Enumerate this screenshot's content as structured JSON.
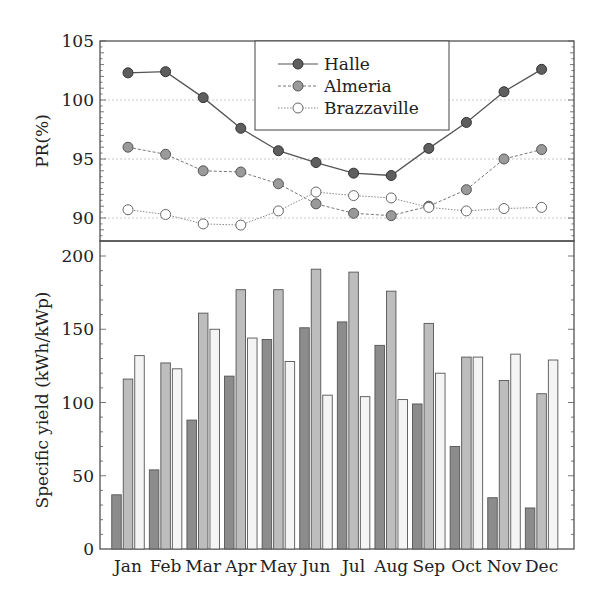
{
  "chart_data": [
    {
      "type": "line",
      "panel": "top",
      "title": "",
      "xlabel": "",
      "ylabel": "PR(%)",
      "ylim": [
        88.0,
        105
      ],
      "yticks": [
        90,
        95,
        100,
        105
      ],
      "grid": "horizontal dotted at 90, 95, 100",
      "legend_position": "upper center (boxed)",
      "categories": [
        "Jan",
        "Feb",
        "Mar",
        "Apr",
        "May",
        "Jun",
        "Jul",
        "Aug",
        "Sep",
        "Oct",
        "Nov",
        "Dec"
      ],
      "series": [
        {
          "name": "Halle",
          "marker": "dark-filled-circle",
          "line": "solid",
          "values": [
            102.3,
            102.4,
            100.2,
            97.6,
            95.7,
            94.7,
            93.8,
            93.6,
            95.9,
            98.1,
            100.7,
            102.6
          ]
        },
        {
          "name": "Almeria",
          "marker": "grey-filled-circle",
          "line": "dashed",
          "values": [
            96.0,
            95.4,
            94.0,
            93.9,
            92.9,
            91.2,
            90.4,
            90.2,
            91.0,
            92.4,
            95.0,
            95.8
          ]
        },
        {
          "name": "Brazzaville",
          "marker": "open-circle",
          "line": "dotted",
          "values": [
            90.7,
            90.3,
            89.5,
            89.4,
            90.6,
            92.2,
            91.9,
            91.7,
            90.9,
            90.6,
            90.8,
            90.9
          ]
        }
      ]
    },
    {
      "type": "bar",
      "panel": "bottom",
      "title": "",
      "xlabel": "",
      "ylabel": "Specific yield (kWh/kWp)",
      "ylim": [
        0,
        210
      ],
      "yticks": [
        0,
        50,
        100,
        150,
        200
      ],
      "grid": "off",
      "categories": [
        "Jan",
        "Feb",
        "Mar",
        "Apr",
        "May",
        "Jun",
        "Jul",
        "Aug",
        "Sep",
        "Oct",
        "Nov",
        "Dec"
      ],
      "series": [
        {
          "name": "Halle",
          "fill": "#8c8c8c",
          "values": [
            37,
            54,
            88,
            118,
            143,
            151,
            155,
            139,
            99,
            70,
            35,
            28
          ]
        },
        {
          "name": "Almeria",
          "fill": "#bdbdbd",
          "values": [
            116,
            127,
            161,
            177,
            177,
            191,
            189,
            176,
            154,
            131,
            115,
            106
          ]
        },
        {
          "name": "Brazzaville",
          "fill": "#f4f4f4",
          "values": [
            132,
            123,
            150,
            144,
            128,
            105,
            104,
            102,
            120,
            131,
            133,
            129
          ]
        }
      ]
    }
  ],
  "legend": {
    "items": [
      {
        "label": "Halle"
      },
      {
        "label": "Almeria"
      },
      {
        "label": "Brazzaville"
      }
    ]
  },
  "axes": {
    "top_ylabel": "PR(%)",
    "bottom_ylabel": "Specific yield (kWh/kWp)",
    "top_ticks": [
      "90",
      "95",
      "100",
      "105"
    ],
    "bottom_ticks": [
      "0",
      "50",
      "100",
      "150",
      "200"
    ],
    "months": [
      "Jan",
      "Feb",
      "Mar",
      "Apr",
      "May",
      "Jun",
      "Jul",
      "Aug",
      "Sep",
      "Oct",
      "Nov",
      "Dec"
    ]
  },
  "colors": {
    "halle_marker": "#5e5e5e",
    "almeria_marker": "#9a9a9a",
    "brazzaville_marker": "#ffffff",
    "halle_bar": "#8c8c8c",
    "almeria_bar": "#bdbdbd",
    "brazzaville_bar": "#f4f4f4",
    "axis": "#444444",
    "grid": "#c8c8c8"
  }
}
